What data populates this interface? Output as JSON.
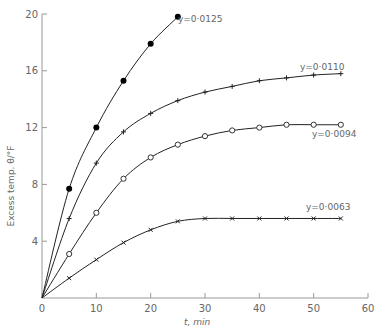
{
  "chart_data": {
    "type": "line",
    "title": "",
    "xlabel": "t, min",
    "ylabel": "Excess temp. θ/°F",
    "xlim": [
      0,
      60
    ],
    "ylim": [
      0,
      20
    ],
    "xticks": [
      0,
      10,
      20,
      30,
      40,
      50,
      60
    ],
    "yticks": [
      4,
      8,
      12,
      16,
      20
    ],
    "grid": false,
    "legend": "inline labels at curve ends",
    "series": [
      {
        "name": "y=0·0125",
        "marker": "filled-circle",
        "x": [
          0,
          5,
          10,
          15,
          20,
          25
        ],
        "y": [
          0,
          7.7,
          12.0,
          15.3,
          17.9,
          19.8
        ]
      },
      {
        "name": "y=0·0110",
        "marker": "plus",
        "x": [
          0,
          5,
          10,
          15,
          20,
          25,
          30,
          35,
          40,
          45,
          50,
          55
        ],
        "y": [
          0,
          5.6,
          9.5,
          11.7,
          13.0,
          13.9,
          14.5,
          14.9,
          15.3,
          15.5,
          15.7,
          15.8
        ]
      },
      {
        "name": "y=0·0094",
        "marker": "open-circle",
        "x": [
          0,
          5,
          10,
          15,
          20,
          25,
          30,
          35,
          40,
          45,
          50,
          55
        ],
        "y": [
          0,
          3.1,
          6.0,
          8.4,
          9.9,
          10.8,
          11.4,
          11.8,
          12.0,
          12.2,
          12.2,
          12.2
        ]
      },
      {
        "name": "y=0·0063",
        "marker": "cross",
        "x": [
          0,
          5,
          10,
          15,
          20,
          25,
          30,
          35,
          40,
          45,
          50,
          55
        ],
        "y": [
          0,
          1.4,
          2.7,
          3.9,
          4.8,
          5.4,
          5.6,
          5.6,
          5.6,
          5.6,
          5.6,
          5.6
        ]
      }
    ]
  }
}
